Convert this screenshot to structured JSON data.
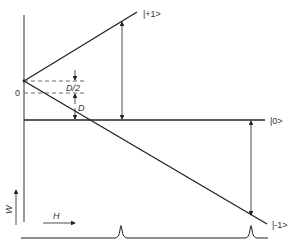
{
  "diagram": {
    "type": "zeeman-energy-level-diagram",
    "states": [
      {
        "id": "plus1",
        "label": "|+1>"
      },
      {
        "id": "zero",
        "label": "|0>"
      },
      {
        "id": "minus1",
        "label": "|-1>"
      }
    ],
    "labels": {
      "origin": "0",
      "half_splitting": "D/2",
      "splitting": "D",
      "energy_axis": "W",
      "field_axis": "H"
    },
    "spectrum": {
      "peaks": 2,
      "description": "absorption lines at two field values"
    },
    "colors": {
      "line": "#222222",
      "background": "#ffffff"
    }
  }
}
